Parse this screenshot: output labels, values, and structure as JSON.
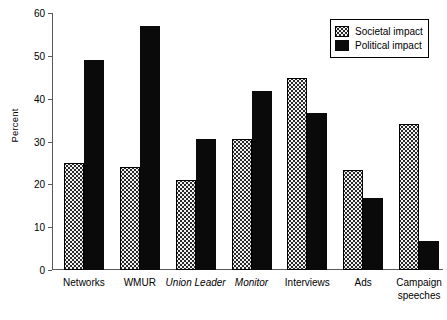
{
  "chart_data": {
    "type": "bar",
    "title": "",
    "subtitle": "",
    "xlabel": "",
    "ylabel": "Percent",
    "ylim": [
      0,
      60
    ],
    "yticks": [
      0,
      10,
      20,
      30,
      40,
      50,
      60
    ],
    "ytick_labels": [
      "0",
      "10",
      "20",
      "30",
      "40",
      "50",
      "60"
    ],
    "grid": false,
    "legend_position": "top-right",
    "categories": [
      "Networks",
      "WMUR",
      "Union Leader",
      "Monitor",
      "Interviews",
      "Ads",
      "Campaign speeches"
    ],
    "category_styles": [
      "normal",
      "normal",
      "italic",
      "italic",
      "normal",
      "normal",
      "normal"
    ],
    "series": [
      {
        "name": "Societal impact",
        "color": "#f2f2f2",
        "pattern": "dotted",
        "values": [
          25.0,
          24.0,
          21.0,
          30.6,
          44.9,
          23.4,
          34.0
        ]
      },
      {
        "name": "Political impact",
        "color": "#0a0a0a",
        "pattern": "solid",
        "values": [
          49.0,
          57.0,
          30.7,
          41.7,
          36.7,
          16.7,
          6.8
        ]
      }
    ]
  },
  "axis": {
    "y_title": "Percent"
  },
  "legend": {
    "entries": [
      {
        "label": "Societal impact",
        "swatch": "dotted-swatch"
      },
      {
        "label": "Political impact",
        "swatch": "solid-black-swatch"
      }
    ]
  }
}
